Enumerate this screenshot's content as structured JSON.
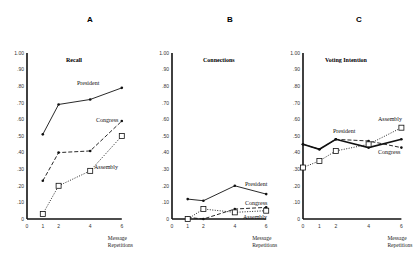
{
  "chart_data": [
    {
      "type": "line",
      "panel": "A",
      "title": "Recall",
      "xlabel": "Message Repetitions",
      "ylabel": "",
      "ylim": [
        0,
        1.0
      ],
      "yticks": [
        "0",
        ".10",
        ".20",
        ".30",
        ".40",
        ".50",
        ".60",
        ".70",
        ".80",
        ".90",
        "1.00"
      ],
      "xticks": [
        "0",
        "1",
        "2",
        "4",
        "6"
      ],
      "x": [
        1,
        2,
        4,
        6
      ],
      "series": [
        {
          "name": "President",
          "style": "solid",
          "marker": "dot",
          "values": [
            0.51,
            0.69,
            0.72,
            0.79
          ]
        },
        {
          "name": "Congress",
          "style": "dash",
          "marker": "dot",
          "values": [
            0.23,
            0.4,
            0.41,
            0.59
          ]
        },
        {
          "name": "Assembly",
          "style": "dotted",
          "marker": "square",
          "values": [
            0.03,
            0.2,
            0.29,
            0.5
          ]
        }
      ]
    },
    {
      "type": "line",
      "panel": "B",
      "title": "Connections",
      "xlabel": "Message Repetitions",
      "ylabel": "",
      "ylim": [
        0,
        1.0
      ],
      "yticks": [
        "0",
        ".10",
        ".20",
        ".30",
        ".40",
        ".50",
        ".60",
        ".70",
        ".80",
        ".90",
        "1.00"
      ],
      "xticks": [
        "0",
        "1",
        "2",
        "4",
        "6"
      ],
      "x": [
        1,
        2,
        4,
        6
      ],
      "series": [
        {
          "name": "President",
          "style": "solid",
          "marker": "dot",
          "values": [
            0.12,
            0.11,
            0.2,
            0.15
          ]
        },
        {
          "name": "Congress",
          "style": "dash",
          "marker": "dot",
          "values": [
            0.01,
            0.0,
            0.06,
            0.07
          ]
        },
        {
          "name": "Assembly",
          "style": "dotted",
          "marker": "square",
          "values": [
            0.0,
            0.06,
            0.04,
            0.05
          ]
        }
      ]
    },
    {
      "type": "line",
      "panel": "C",
      "title": "Voting Intention",
      "xlabel": "Message Repetitions",
      "ylabel": "",
      "ylim": [
        0,
        1.0
      ],
      "yticks": [
        "0",
        ".10",
        ".20",
        ".30",
        ".40",
        ".50",
        ".60",
        ".70",
        ".80",
        ".90",
        "1.00"
      ],
      "xticks": [
        "0",
        "1",
        "2",
        "4",
        "6"
      ],
      "x": [
        0,
        1,
        2,
        4,
        6
      ],
      "series": [
        {
          "name": "President",
          "style": "solid",
          "marker": "dot",
          "values": [
            0.45,
            0.42,
            0.48,
            0.43,
            0.48
          ]
        },
        {
          "name": "Congress",
          "style": "dash",
          "marker": "dot",
          "values": [
            0.45,
            0.42,
            0.48,
            0.47,
            0.43
          ]
        },
        {
          "name": "Assembly",
          "style": "dotted",
          "marker": "square",
          "values": [
            0.31,
            0.35,
            0.41,
            0.45,
            0.55
          ]
        }
      ]
    }
  ],
  "labels": {
    "panel_a": "A",
    "panel_b": "B",
    "panel_c": "C",
    "recall": "Recall",
    "connections": "Connections",
    "voting": "Voting Intention",
    "president": "President",
    "congress": "Congress",
    "assembly": "Assembly",
    "xlabel_line1": "Message",
    "xlabel_line2": "Repetitions"
  }
}
